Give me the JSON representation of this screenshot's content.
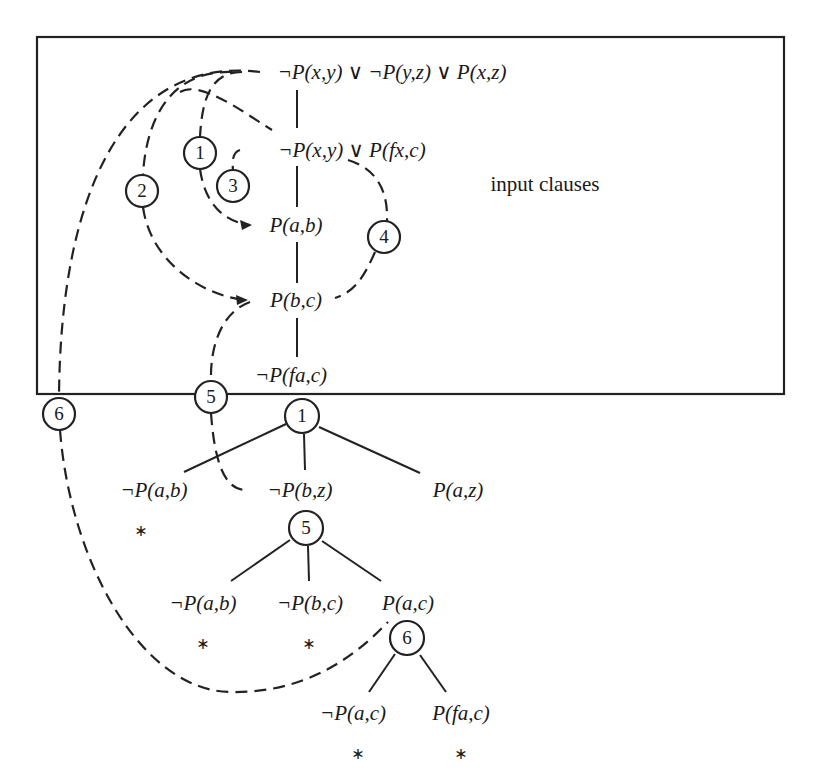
{
  "diagram": {
    "box_label": "input clauses",
    "input_clauses": [
      {
        "id": "c1",
        "text": "¬P(x,y) ∨ ¬P(y,z) ∨ P(x,z)",
        "x": 392,
        "y": 72
      },
      {
        "id": "c2",
        "text": "¬P(x,y) ∨ P(fx,c)",
        "x": 352,
        "y": 150
      },
      {
        "id": "c3",
        "text": "P(a,b)",
        "x": 296,
        "y": 225
      },
      {
        "id": "c4",
        "text": "P(b,c)",
        "x": 296,
        "y": 300
      },
      {
        "id": "c5",
        "text": "¬P(fa,c)",
        "x": 291,
        "y": 375
      }
    ],
    "step_markers": [
      {
        "label": "1",
        "x": 200,
        "y": 153
      },
      {
        "label": "2",
        "x": 142,
        "y": 191
      },
      {
        "label": "3",
        "x": 233,
        "y": 186
      },
      {
        "label": "4",
        "x": 384,
        "y": 237
      },
      {
        "label": "5",
        "x": 211,
        "y": 397
      },
      {
        "label": "6",
        "x": 59,
        "y": 414
      }
    ],
    "tree_nodes": [
      {
        "label": "1",
        "x": 302,
        "y": 416
      },
      {
        "label": "5",
        "x": 306,
        "y": 528
      },
      {
        "label": "6",
        "x": 407,
        "y": 638
      }
    ],
    "tree_leaves": [
      {
        "text": "¬P(a,b)",
        "x": 154,
        "y": 490
      },
      {
        "text": "¬P(b,z)",
        "x": 300,
        "y": 490
      },
      {
        "text": "P(a,z)",
        "x": 458,
        "y": 490
      },
      {
        "text": "¬P(a,b)",
        "x": 203,
        "y": 603
      },
      {
        "text": "¬P(b,c)",
        "x": 310,
        "y": 603
      },
      {
        "text": "P(a,c)",
        "x": 408,
        "y": 603
      },
      {
        "text": "¬P(a,c)",
        "x": 353,
        "y": 713
      },
      {
        "text": "P(fa,c)",
        "x": 461,
        "y": 713
      }
    ],
    "closed_marks": [
      {
        "symbol": "∗",
        "x": 141,
        "y": 530
      },
      {
        "symbol": "∗",
        "x": 203,
        "y": 643
      },
      {
        "symbol": "∗",
        "x": 309,
        "y": 643
      },
      {
        "symbol": "∗",
        "x": 358,
        "y": 753
      },
      {
        "symbol": "∗",
        "x": 461,
        "y": 753
      }
    ]
  }
}
